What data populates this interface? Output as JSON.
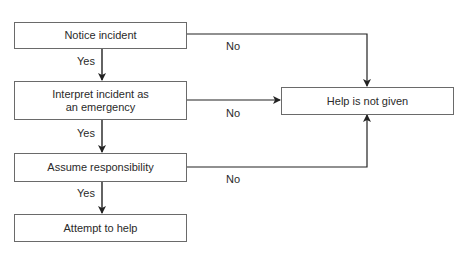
{
  "nodes": {
    "notice": "Notice incident",
    "interpret": "Interpret incident as an emergency",
    "assume": "Assume responsibility",
    "attempt": "Attempt to help",
    "not_given": "Help is not given"
  },
  "edges": {
    "notice_yes": "Yes",
    "notice_no": "No",
    "interpret_yes": "Yes",
    "interpret_no": "No",
    "assume_yes": "Yes",
    "assume_no": "No"
  }
}
